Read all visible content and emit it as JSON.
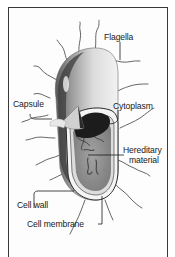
{
  "diagram": {
    "labels": [
      {
        "id": "flagella",
        "text": "Flagella"
      },
      {
        "id": "capsule",
        "text": "Capsule"
      },
      {
        "id": "cytoplasm",
        "text": "Cytoplasm"
      },
      {
        "id": "hereditary_material_line1",
        "text": "Hereditary"
      },
      {
        "id": "hereditary_material_line2",
        "text": "material"
      },
      {
        "id": "cell_wall",
        "text": "Cell wall"
      },
      {
        "id": "cell_membrane",
        "text": "Cell membrane"
      }
    ],
    "colors": {
      "frame": "#3a3a3a",
      "text": "#1a1a1a",
      "capsule_light": "#e6e6e6",
      "cell_dark": "#4a4a4a",
      "cytoplasm": "#8a8a8a"
    }
  }
}
